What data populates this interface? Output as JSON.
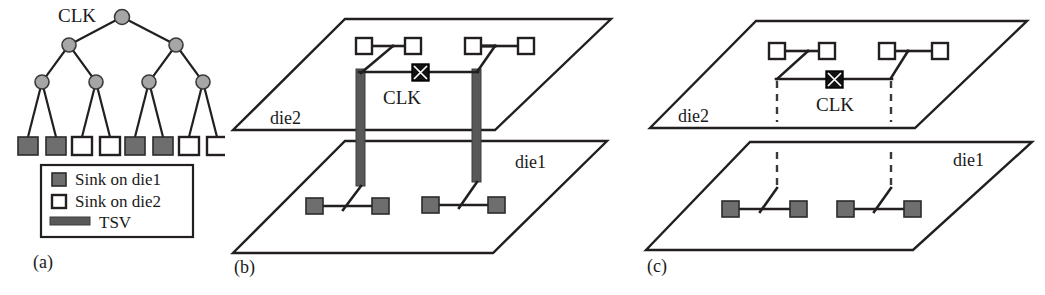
{
  "figure": {
    "caption_labels": [
      "(a)",
      "(b)",
      "(c)"
    ],
    "background_color": "#ffffff",
    "ink_color": "#231f20"
  },
  "colors": {
    "wire": "#231f20",
    "tsv": "#585858",
    "sink_die1_fill": "#6e6e6e",
    "sink_die2_fill": "#ffffff",
    "tree_node": "#a6a6a6",
    "clk_source": "#111111",
    "dashed_via": "#3a3a3a"
  },
  "panel_a": {
    "label": "(a)",
    "clk_label": "CLK",
    "tree": {
      "levels": 4,
      "root_label": "CLK",
      "leaf_count": 8,
      "leaf_types": [
        "die1",
        "die1",
        "die2",
        "die2",
        "die1",
        "die1",
        "die2",
        "die2"
      ]
    },
    "legend": {
      "items": [
        {
          "marker": "filled-square",
          "label": "Sink on die1"
        },
        {
          "marker": "open-square",
          "label": "Sink on die2"
        },
        {
          "marker": "thick-gray-bar",
          "label": "TSV"
        }
      ]
    }
  },
  "panel_b": {
    "label": "(b)",
    "clk_label": "CLK",
    "die_top_label": "die2",
    "die_bottom_label": "die1",
    "via_style": "tsv-solid-bar",
    "via_count": 2,
    "sinks_top": 4,
    "sinks_bottom": 4,
    "sink_top_type": "open-square",
    "sink_bottom_type": "filled-square"
  },
  "panel_c": {
    "label": "(c)",
    "clk_label": "CLK",
    "die_top_label": "die2",
    "die_bottom_label": "die1",
    "via_style": "dashed-line",
    "via_count": 2,
    "sinks_top": 4,
    "sinks_bottom": 4,
    "sink_top_type": "open-square",
    "sink_bottom_type": "filled-square"
  }
}
